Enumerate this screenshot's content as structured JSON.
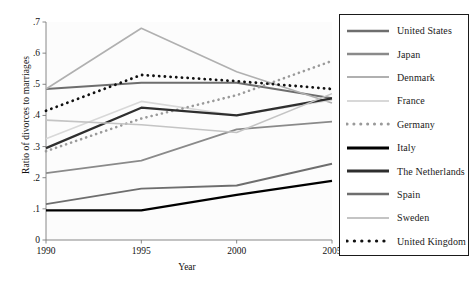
{
  "chart_data": {
    "type": "line",
    "title": "",
    "xlabel": "Year",
    "ylabel": "Ratio of divorces to marriages",
    "x": [
      1990,
      1995,
      2000,
      2005
    ],
    "xtick_labels": [
      "1990",
      "1995",
      "2000",
      "2005"
    ],
    "ytick_labels": [
      "0",
      ".1",
      ".2",
      ".3",
      ".4",
      ".5",
      ".6",
      ".7"
    ],
    "ytick_values": [
      0,
      0.1,
      0.2,
      0.3,
      0.4,
      0.5,
      0.6,
      0.7
    ],
    "xlim": [
      1990,
      2005
    ],
    "ylim": [
      0,
      0.7
    ],
    "grid": false,
    "legend_position": "right-outside",
    "series": [
      {
        "name": "United States",
        "values": [
          0.485,
          0.505,
          0.505,
          0.455
        ],
        "color": "#6e6e6e",
        "style": "solid",
        "width": 2.0
      },
      {
        "name": "Japan",
        "values": [
          0.215,
          0.255,
          0.355,
          0.38
        ],
        "color": "#8a8a8a",
        "style": "solid",
        "width": 1.8
      },
      {
        "name": "Denmark",
        "values": [
          0.485,
          0.68,
          0.54,
          0.44
        ],
        "color": "#b0b0b0",
        "style": "solid",
        "width": 1.6
      },
      {
        "name": "France",
        "values": [
          0.325,
          0.445,
          0.4,
          0.45
        ],
        "color": "#d8d8d8",
        "style": "solid",
        "width": 1.6
      },
      {
        "name": "Germany",
        "values": [
          0.285,
          0.39,
          0.465,
          0.575
        ],
        "color": "#9a9a9a",
        "style": "dotted",
        "width": 2.6
      },
      {
        "name": "Italy",
        "values": [
          0.095,
          0.095,
          0.145,
          0.19
        ],
        "color": "#000000",
        "style": "solid",
        "width": 2.2
      },
      {
        "name": "The Netherlands",
        "values": [
          0.295,
          0.425,
          0.4,
          0.455
        ],
        "color": "#2e2e2e",
        "style": "solid",
        "width": 2.2
      },
      {
        "name": "Spain",
        "values": [
          0.115,
          0.165,
          0.175,
          0.245
        ],
        "color": "#6e6e6e",
        "style": "solid",
        "width": 1.9
      },
      {
        "name": "Sweden",
        "values": [
          0.385,
          0.37,
          0.345,
          0.47
        ],
        "color": "#c4c4c4",
        "style": "solid",
        "width": 1.6
      },
      {
        "name": "United Kingdom",
        "values": [
          0.415,
          0.53,
          0.51,
          0.485
        ],
        "color": "#111111",
        "style": "dotted",
        "width": 2.8
      }
    ]
  }
}
